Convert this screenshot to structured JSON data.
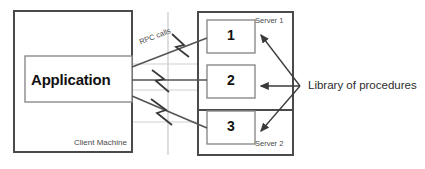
{
  "diagram": {
    "client": {
      "machine_label": "Client Machine",
      "application_label": "Application"
    },
    "rpc": {
      "calls_label": "RPC calls"
    },
    "servers": [
      {
        "label": "Server 1"
      },
      {
        "label": "Server 2"
      }
    ],
    "procedures": [
      {
        "number": "1"
      },
      {
        "number": "2"
      },
      {
        "number": "3"
      }
    ],
    "library": {
      "label": "Library of procedures"
    },
    "colors": {
      "stroke_dark": "#3a3a3a",
      "stroke_mid": "#6b6b6b",
      "stroke_light": "#b8b8b8",
      "text": "#2b2b2b",
      "background": "#ffffff"
    }
  }
}
